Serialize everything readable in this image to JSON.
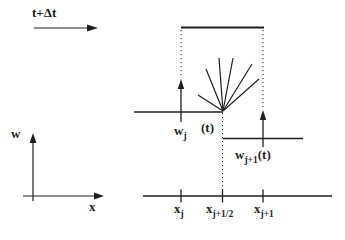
{
  "figure": {
    "colors": {
      "ink": "#1f1f1f",
      "background": "#ffffff"
    },
    "time_label": "t+Δt",
    "w_axis_label": "w",
    "x_axis_label": "x",
    "left_state": {
      "base": "w",
      "sub": "j",
      "arg": "(t)"
    },
    "right_state": {
      "base": "w",
      "sub": "j+1",
      "arg": "(t)"
    },
    "ticks": [
      {
        "base": "x",
        "sub": "j"
      },
      {
        "base": "x",
        "sub": "j+1/2"
      },
      {
        "base": "x",
        "sub": "j+1"
      }
    ]
  }
}
